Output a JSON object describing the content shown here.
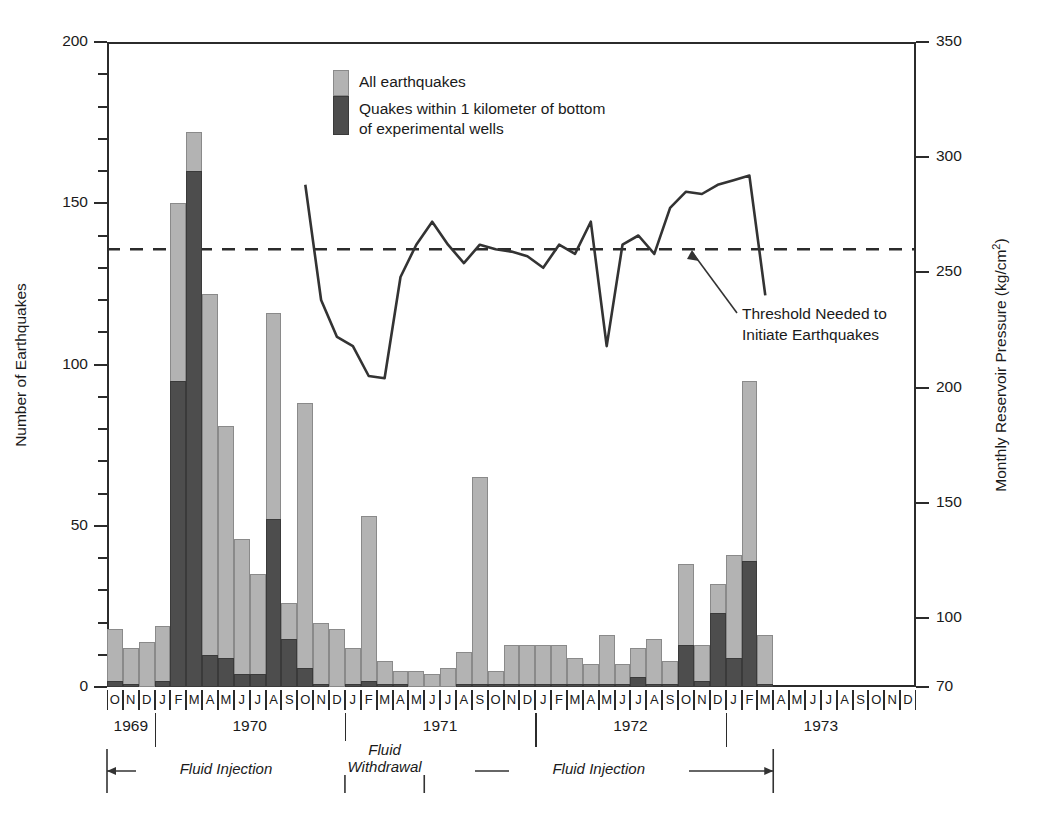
{
  "chart_data": {
    "type": "bar",
    "title": "",
    "ylabel": "Number of Earthquakes",
    "ylabel_right": "Monthly Reservoir Pressure  (kg/cm²)",
    "xlabel": "",
    "ylim": [
      0,
      200
    ],
    "yticks": [
      0,
      50,
      100,
      150,
      200
    ],
    "ylim_right": [
      70,
      350
    ],
    "yticks_right": [
      70,
      100,
      150,
      200,
      250,
      300,
      350
    ],
    "grid": false,
    "legend_position": "top-center",
    "categories": [
      "O",
      "N",
      "D",
      "J",
      "F",
      "M",
      "A",
      "M",
      "J",
      "J",
      "A",
      "S",
      "O",
      "N",
      "D",
      "J",
      "F",
      "M",
      "A",
      "M",
      "J",
      "J",
      "A",
      "S",
      "O",
      "N",
      "D",
      "J",
      "F",
      "M",
      "A",
      "M",
      "J",
      "J",
      "A",
      "S",
      "O",
      "N",
      "D",
      "J",
      "F",
      "M",
      "A",
      "M",
      "J",
      "J",
      "A",
      "S",
      "O",
      "N",
      "D"
    ],
    "year_labels": [
      "1969",
      "1970",
      "1971",
      "1972",
      "1973"
    ],
    "series": [
      {
        "name": "All earthquakes",
        "color": "#b3b3b3",
        "values": [
          18,
          12,
          14,
          19,
          150,
          172,
          122,
          81,
          46,
          35,
          116,
          26,
          88,
          20,
          18,
          12,
          53,
          8,
          5,
          5,
          4,
          6,
          11,
          65,
          5,
          13,
          13,
          13,
          13,
          9,
          7,
          16,
          7,
          12,
          15,
          8,
          38,
          13,
          32,
          41,
          95,
          16,
          0,
          0,
          0,
          0,
          0,
          0,
          0,
          0,
          0
        ]
      },
      {
        "name": "Quakes within 1 kilometer of bottom of experimental wells",
        "color": "#4d4d4d",
        "values": [
          2,
          1,
          0,
          2,
          95,
          160,
          10,
          9,
          4,
          4,
          52,
          15,
          6,
          1,
          0,
          1,
          2,
          1,
          1,
          0,
          0,
          0,
          1,
          1,
          1,
          1,
          1,
          1,
          1,
          1,
          1,
          1,
          1,
          3,
          1,
          1,
          13,
          2,
          23,
          9,
          39,
          1,
          0,
          0,
          0,
          0,
          0,
          0,
          0,
          0,
          0
        ]
      }
    ],
    "pressure_line": {
      "name": "Monthly Reservoir Pressure",
      "units": "kg/cm²",
      "start_index": 12,
      "values": [
        288,
        238,
        222,
        218,
        205,
        204,
        248,
        262,
        272,
        262,
        254,
        262,
        260,
        259,
        257,
        252,
        262,
        258,
        272,
        218,
        262,
        266,
        258,
        278,
        285,
        284,
        288,
        290,
        292,
        240
      ]
    },
    "threshold": {
      "value": 260,
      "label_line1": "Threshold Needed to",
      "label_line2": "Initiate Earthquakes",
      "style": "dashed"
    },
    "phases": [
      {
        "label_line1": "Fluid Injection",
        "label_line2": "",
        "start_index": 0,
        "end_index": 15
      },
      {
        "label_line1": "Fluid",
        "label_line2": "Withdrawal",
        "start_index": 15,
        "end_index": 20
      },
      {
        "label_line1": "Fluid Injection",
        "label_line2": "",
        "start_index": 20,
        "end_index": 42
      }
    ]
  },
  "legend": {
    "entries": [
      {
        "label": "All earthquakes"
      },
      {
        "label_line1": "Quakes within 1 kilometer of bottom",
        "label_line2": "of experimental wells"
      }
    ]
  },
  "axes": {
    "left_title": "Number of Earthquakes",
    "right_title_main": "Monthly Reservoir Pressure  (kg/cm",
    "right_title_sup": "2",
    "right_title_end": ")",
    "left_ticks": [
      "200",
      "150",
      "100",
      "50",
      "0"
    ],
    "right_ticks": [
      "350",
      "300",
      "250",
      "200",
      "150",
      "100",
      "70"
    ]
  },
  "annotation": {
    "line1": "Threshold Needed to",
    "line2": "Initiate Earthquakes"
  }
}
